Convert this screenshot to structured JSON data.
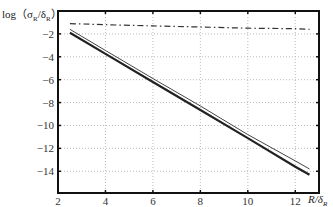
{
  "chart_data": {
    "type": "line",
    "title": "",
    "xlabel": "R/δ_R",
    "ylabel": "log（σ_R/δ_R）",
    "xlim": [
      2,
      13
    ],
    "ylim": [
      -15.9,
      0
    ],
    "xticks": [
      2,
      4,
      6,
      8,
      10,
      12
    ],
    "yticks": [
      -2,
      -4,
      -6,
      -8,
      -10,
      -12,
      -14
    ],
    "grid": true,
    "grid_style": "dotted",
    "legend": null,
    "series": [
      {
        "name": "dash-dot curve",
        "style": "dash-dot",
        "color": "#333333",
        "x": [
          2.5,
          4,
          6,
          8,
          10,
          12,
          12.6
        ],
        "y": [
          -1.1,
          -1.2,
          -1.3,
          -1.4,
          -1.5,
          -1.55,
          -1.6
        ]
      },
      {
        "name": "thin solid line",
        "style": "solid-thin",
        "color": "#444444",
        "x": [
          2.5,
          4,
          6,
          8,
          10,
          12,
          12.6
        ],
        "y": [
          -1.6,
          -3.45,
          -5.9,
          -8.3,
          -10.8,
          -13.1,
          -13.8
        ]
      },
      {
        "name": "thick solid line",
        "style": "solid-thick",
        "color": "#222222",
        "x": [
          2.5,
          4,
          6,
          8,
          10,
          12,
          12.6
        ],
        "y": [
          -1.9,
          -3.75,
          -6.2,
          -8.65,
          -11.1,
          -13.6,
          -14.3
        ]
      }
    ]
  },
  "axes": {
    "ylabel_text": "log（σ",
    "ylabel_sub1": "R",
    "ylabel_mid": "/δ",
    "ylabel_sub2": "R",
    "ylabel_end": "）",
    "xlabel_main": "R/δ",
    "xlabel_sub": "R"
  }
}
